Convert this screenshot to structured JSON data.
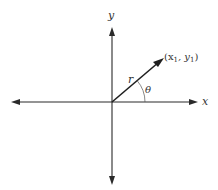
{
  "diagram": {
    "type": "polar-coordinate-vector",
    "colors": {
      "axis": "#2a2a2a",
      "vector": "#1f1f1f",
      "text": "#333333",
      "background": "#ffffff"
    },
    "axes": {
      "x_label": "x",
      "y_label": "y"
    },
    "vector": {
      "magnitude_label": "r",
      "angle_label": "θ",
      "endpoint_label_open": "(x",
      "endpoint_sub1": "1",
      "endpoint_sep": ", y",
      "endpoint_sub2": "1",
      "endpoint_label_close": ")"
    }
  }
}
